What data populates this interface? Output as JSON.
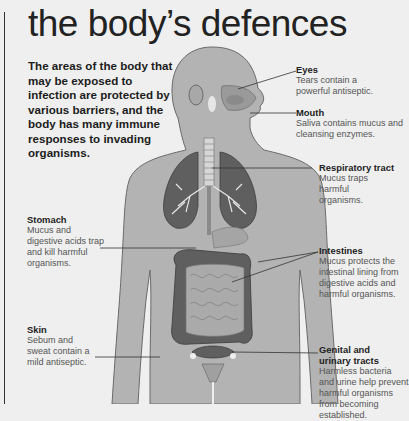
{
  "title": "the body’s defences",
  "intro": "The areas of the body that may be exposed to infection are protected by various barriers, and the body has many immune responses to invading organisms.",
  "labels": {
    "eyes": {
      "heading": "Eyes",
      "text": "Tears contain a powerful antiseptic."
    },
    "mouth": {
      "heading": "Mouth",
      "text": "Saliva contains mucus and cleansing enzymes."
    },
    "respiratory": {
      "heading": "Respiratory tract",
      "text": "Mucus traps harmful organisms."
    },
    "stomach": {
      "heading": "Stomach",
      "text": "Mucus and digestive acids trap and kill harmful organisms."
    },
    "intestines": {
      "heading": "Intestines",
      "text": "Mucus protects the intestinal lining from digestive acids and harmful organisms."
    },
    "skin": {
      "heading": "Skin",
      "text": "Sebum and sweat contain a mild antiseptic."
    },
    "genital": {
      "heading": "Genital and urinary tracts",
      "text": "Harmless bacteria and urine help prevent harmful organisms from becoming established."
    }
  },
  "colors": {
    "background": "#efefef",
    "body": "#b3b3b3",
    "body_outline": "#6a6a6a",
    "organ_dark": "#5f5f5f",
    "organ_mid": "#8a8a8a"
  }
}
